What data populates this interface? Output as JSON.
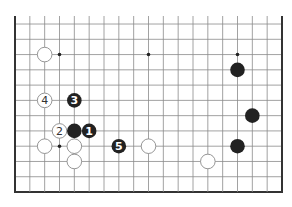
{
  "diagram": {
    "type": "go-board",
    "board_size": 19,
    "visible_rows": [
      1,
      12
    ],
    "top_edge_open": true,
    "colors": {
      "background": "#ffffff",
      "grid_line": "#8a8a8a",
      "edge_line": "#333333",
      "black_stone": "#222222",
      "white_stone_fill": "#ffffff",
      "white_stone_stroke": "#8a8a8a",
      "star_point": "#222222"
    },
    "star_points": [
      {
        "col": 4,
        "row": 4
      },
      {
        "col": 4,
        "row": 10
      },
      {
        "col": 10,
        "row": 10
      },
      {
        "col": 16,
        "row": 10
      }
    ],
    "stones": [
      {
        "color": "white",
        "col": 3,
        "row": 10,
        "label": ""
      },
      {
        "color": "black",
        "col": 16,
        "row": 9,
        "label": ""
      },
      {
        "color": "white",
        "col": 3,
        "row": 7,
        "label": "4"
      },
      {
        "color": "black",
        "col": 5,
        "row": 7,
        "label": "3"
      },
      {
        "color": "black",
        "col": 17,
        "row": 6,
        "label": ""
      },
      {
        "color": "white",
        "col": 4,
        "row": 5,
        "label": "2"
      },
      {
        "color": "black",
        "col": 5,
        "row": 5,
        "label": ""
      },
      {
        "color": "black",
        "col": 6,
        "row": 5,
        "label": "1"
      },
      {
        "color": "white",
        "col": 3,
        "row": 4,
        "label": ""
      },
      {
        "color": "white",
        "col": 5,
        "row": 4,
        "label": ""
      },
      {
        "color": "black",
        "col": 8,
        "row": 4,
        "label": "5"
      },
      {
        "color": "white",
        "col": 10,
        "row": 4,
        "label": ""
      },
      {
        "color": "black",
        "col": 16,
        "row": 4,
        "label": ""
      },
      {
        "color": "white",
        "col": 5,
        "row": 3,
        "label": ""
      },
      {
        "color": "white",
        "col": 14,
        "row": 3,
        "label": ""
      }
    ]
  }
}
